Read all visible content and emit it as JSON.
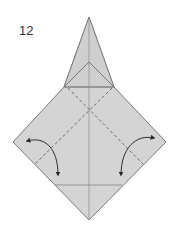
{
  "step": {
    "number": "12"
  },
  "diagram": {
    "colors": {
      "paper_fill": "#d4d4d4",
      "edge": "#6e6e6e",
      "crease_solid": "#808080",
      "crease_dashed": "#5a5a5a",
      "arrow": "#2a2a2a"
    },
    "shapes": {
      "outer_outline": [
        [
          89,
          17
        ],
        [
          114,
          87
        ],
        [
          166,
          142
        ],
        [
          89,
          220
        ],
        [
          13,
          142
        ],
        [
          64,
          87
        ]
      ],
      "inner_triangle": [
        [
          64,
          87
        ],
        [
          89,
          62
        ],
        [
          114,
          87
        ]
      ],
      "center_line": [
        [
          89,
          17
        ],
        [
          89,
          220
        ]
      ],
      "upper_horizontal": [
        [
          64,
          87
        ],
        [
          114,
          87
        ]
      ],
      "lower_horizontal": [
        [
          55,
          185
        ],
        [
          122,
          185
        ]
      ],
      "dashed_left_valley": [
        [
          68,
          88
        ],
        [
          35,
          164
        ]
      ],
      "dashed_right_valley": [
        [
          112,
          88
        ],
        [
          143,
          164
        ]
      ],
      "dashed_x_cross": [
        89,
        108
      ]
    },
    "arrows": [
      {
        "name": "left-fold-arrow",
        "from": [
          26,
          141
        ],
        "to": [
          58,
          176
        ],
        "direction": "fold-and-unfold"
      },
      {
        "name": "right-fold-arrow",
        "from": [
          155,
          138
        ],
        "to": [
          121,
          176
        ],
        "direction": "fold-and-unfold"
      }
    ]
  }
}
